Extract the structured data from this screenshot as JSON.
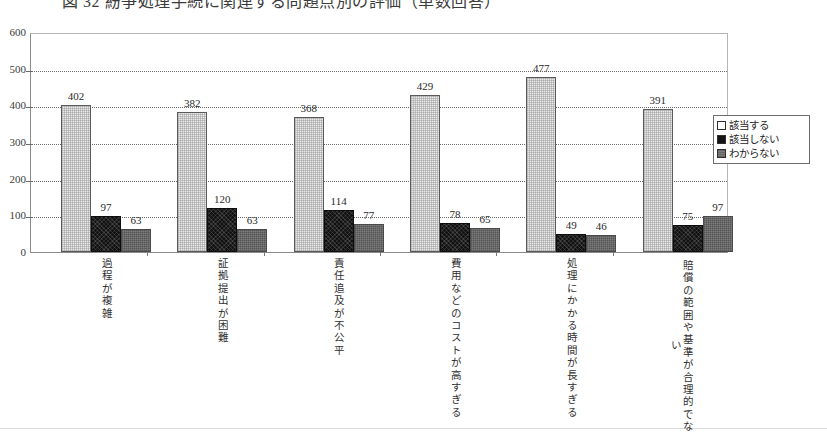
{
  "page": {
    "title_clipped": "図 32  紛争処理手続に関連する問題点別の評価（単数回答）"
  },
  "chart_data": {
    "type": "bar",
    "title": "",
    "xlabel": "",
    "ylabel": "",
    "ylim": [
      0,
      600
    ],
    "yticks": [
      0,
      100,
      200,
      300,
      400,
      500,
      600
    ],
    "grid": true,
    "legend_position": "right",
    "categories": [
      "過程が複雑",
      "証拠提出が困難",
      "責任追及が不公平",
      "費用などのコストが高すぎる",
      "処理にかかる時間が長すぎる",
      "賠償の範囲や基準が合理的でない"
    ],
    "series": [
      {
        "name": "該当する",
        "color": "#e9e9e9",
        "values": [
          402,
          382,
          368,
          429,
          477,
          391
        ]
      },
      {
        "name": "該当しない",
        "color": "#141414",
        "values": [
          97,
          120,
          114,
          78,
          49,
          75
        ]
      },
      {
        "name": "わからない",
        "color": "#7d7d7d",
        "values": [
          63,
          63,
          77,
          65,
          46,
          97
        ]
      }
    ]
  },
  "legend": {
    "items": [
      {
        "label": "該当する"
      },
      {
        "label": "該当しない"
      },
      {
        "label": "わからない"
      }
    ]
  }
}
